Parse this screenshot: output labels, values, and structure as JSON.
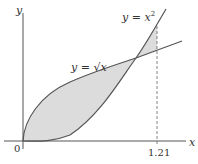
{
  "diagram": {
    "axes": {
      "x_label": "x",
      "y_label": "y",
      "origin_label": "0",
      "x_tick_label": "1.21"
    },
    "curves": [
      {
        "name": "parabola",
        "label": "y = x",
        "exponent": "2"
      },
      {
        "name": "sqrt",
        "label": "y = √x"
      }
    ],
    "shaded_region": {
      "fill": "#d9d9d9",
      "from": 0,
      "to": 1.21
    },
    "colors": {
      "curve": "#555555",
      "axis": "#555555",
      "shade": "#d9d9d9"
    }
  }
}
